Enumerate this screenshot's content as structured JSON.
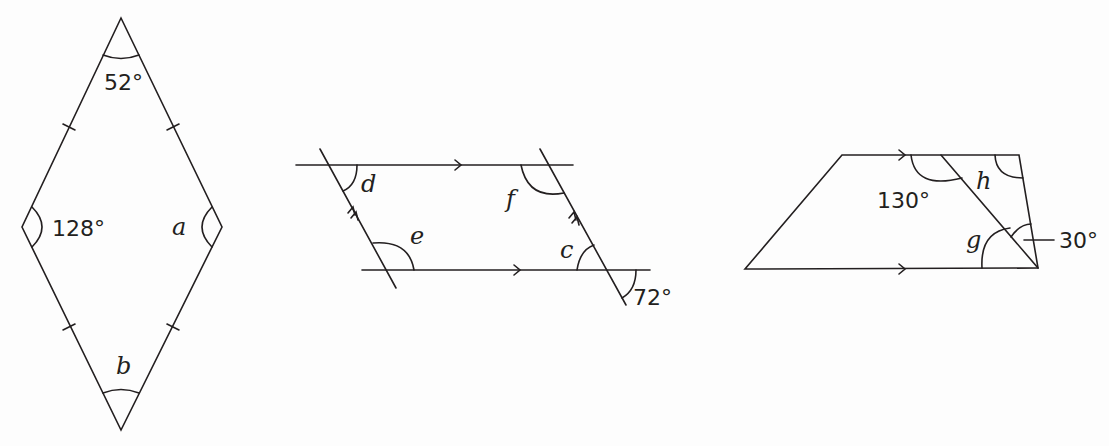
{
  "figures": [
    {
      "name": "rhombus",
      "angles": {
        "top": "52°",
        "left": "128°",
        "right": "a",
        "bottom": "b"
      }
    },
    {
      "name": "parallelogram",
      "angles": {
        "top_left": "d",
        "bottom_left": "e",
        "top_right": "f",
        "bottom_right_inner": "c",
        "bottom_right_outer": "72°"
      }
    },
    {
      "name": "trapezium",
      "angles": {
        "top_mid": "130°",
        "upper_right": "h",
        "lower_right": "g",
        "lower_right_small": "30°"
      }
    }
  ]
}
